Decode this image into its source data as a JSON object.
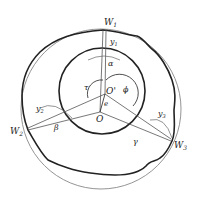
{
  "diagram": {
    "type": "geometric-roundness-measurement",
    "colors": {
      "thick": "#222222",
      "thin": "#888888",
      "background": "#ffffff"
    },
    "points": {
      "W1": {
        "label": "W",
        "sub": "1"
      },
      "W2": {
        "label": "W",
        "sub": "2"
      },
      "W3": {
        "label": "W",
        "sub": "3"
      },
      "O": {
        "label": "O"
      },
      "Oprime": {
        "label": "O'"
      }
    },
    "labels": {
      "y1": {
        "label": "y",
        "sub": "1"
      },
      "y2": {
        "label": "y",
        "sub": "2"
      },
      "y3": {
        "label": "y",
        "sub": "3"
      },
      "alpha": "α",
      "beta": "β",
      "gamma": "γ",
      "tau": "τ",
      "phi": "ϕ",
      "e": "e"
    }
  }
}
